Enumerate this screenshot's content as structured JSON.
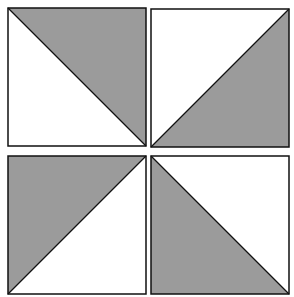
{
  "figure": {
    "colors": {
      "shade": "#9b9b9b",
      "background": "#ffffff",
      "stroke": "#111111"
    },
    "tiles": [
      {
        "id": "top-left",
        "x": 8,
        "y": 8,
        "size": 138,
        "diagonal": "tl-br",
        "shaded": "upper-right"
      },
      {
        "id": "top-right",
        "x": 151,
        "y": 9,
        "size": 138,
        "diagonal": "bl-tr",
        "shaded": "lower-right"
      },
      {
        "id": "bottom-left",
        "x": 8,
        "y": 156,
        "size": 138,
        "diagonal": "bl-tr",
        "shaded": "upper-left"
      },
      {
        "id": "bottom-right",
        "x": 151,
        "y": 156,
        "size": 138,
        "diagonal": "tl-br",
        "shaded": "lower-left"
      }
    ]
  }
}
